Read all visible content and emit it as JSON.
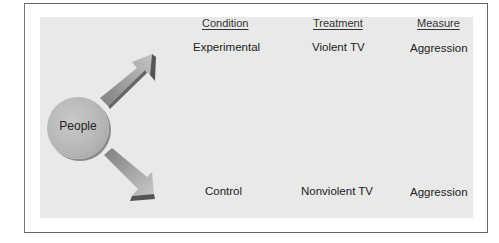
{
  "diagram": {
    "subject": "People",
    "columns": [
      "Condition",
      "Treatment",
      "Measure"
    ],
    "rows": [
      {
        "condition": "Experimental",
        "treatment": "Violent TV",
        "measure": "Aggression"
      },
      {
        "condition": "Control",
        "treatment": "Nonviolent TV",
        "measure": "Aggression"
      }
    ],
    "arrows": [
      "arrow-up-right-to-experimental",
      "arrow-down-right-to-control"
    ],
    "colors": {
      "panel": "#e9e9e9",
      "circle": "#b5b5b5",
      "arrow": "#8c8c8c",
      "border": "#666666"
    }
  }
}
